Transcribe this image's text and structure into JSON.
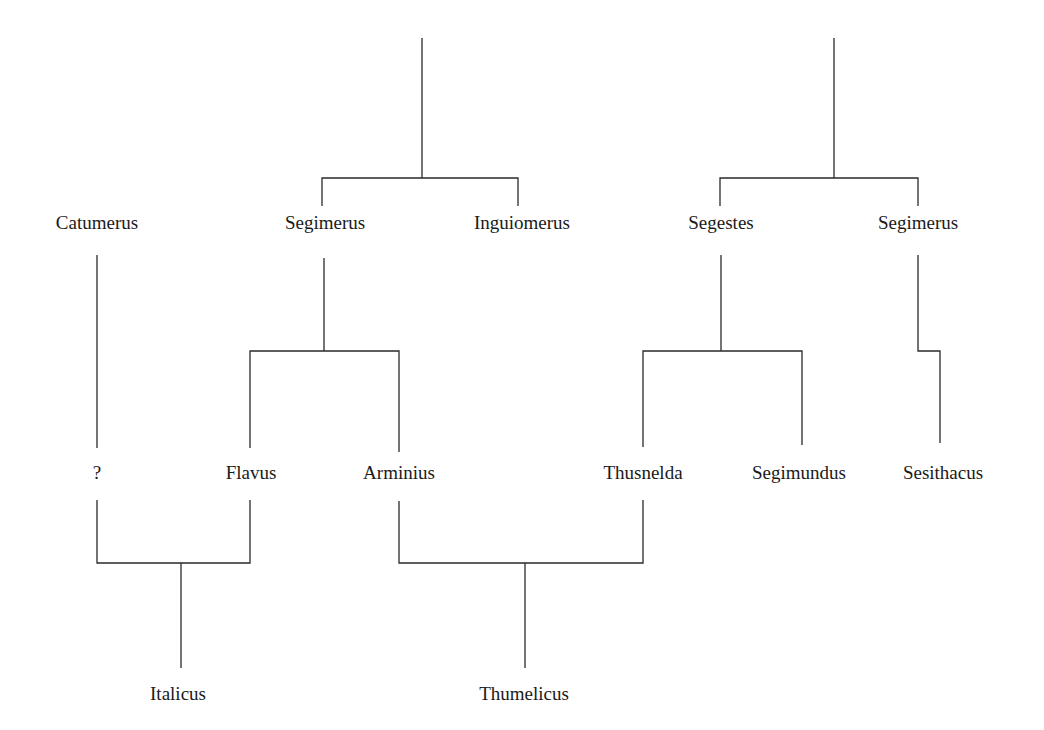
{
  "diagram": {
    "type": "family-tree",
    "people": [
      {
        "id": "catumerus",
        "name": "Catumerus",
        "x": 97,
        "y": 222
      },
      {
        "id": "segimerus1",
        "name": "Segimerus",
        "x": 325,
        "y": 222
      },
      {
        "id": "inguiomerus",
        "name": "Inguiomerus",
        "x": 522,
        "y": 222
      },
      {
        "id": "segestes",
        "name": "Segestes",
        "x": 721,
        "y": 222
      },
      {
        "id": "segimerus2",
        "name": "Segimerus",
        "x": 918,
        "y": 222
      },
      {
        "id": "unknown",
        "name": "?",
        "x": 97,
        "y": 472
      },
      {
        "id": "flavus",
        "name": "Flavus",
        "x": 251,
        "y": 472
      },
      {
        "id": "arminius",
        "name": "Arminius",
        "x": 399,
        "y": 472
      },
      {
        "id": "thusnelda",
        "name": "Thusnelda",
        "x": 643,
        "y": 472
      },
      {
        "id": "segimundus",
        "name": "Segimundus",
        "x": 799,
        "y": 472
      },
      {
        "id": "sesithacus",
        "name": "Sesithacus",
        "x": 943,
        "y": 472
      },
      {
        "id": "italicus",
        "name": "Italicus",
        "x": 178,
        "y": 693
      },
      {
        "id": "thumelicus",
        "name": "Thumelicus",
        "x": 524,
        "y": 693
      }
    ],
    "relations": [
      {
        "type": "siblings",
        "members": [
          "Segimerus",
          "Inguiomerus"
        ]
      },
      {
        "type": "siblings",
        "members": [
          "Segestes",
          "Segimerus"
        ]
      },
      {
        "type": "parent-children",
        "parent": "Segimerus",
        "children": [
          "Flavus",
          "Arminius"
        ]
      },
      {
        "type": "parent-children",
        "parent": "Segestes",
        "children": [
          "Thusnelda",
          "Segimundus"
        ]
      },
      {
        "type": "parent-child",
        "parent": "Segimerus",
        "child": "Sesithacus"
      },
      {
        "type": "parent-child",
        "parent": "Catumerus",
        "child": "?"
      },
      {
        "type": "couple-child",
        "parents": [
          "?",
          "Flavus"
        ],
        "child": "Italicus"
      },
      {
        "type": "couple-child",
        "parents": [
          "Arminius",
          "Thusnelda"
        ],
        "child": "Thumelicus"
      }
    ]
  }
}
